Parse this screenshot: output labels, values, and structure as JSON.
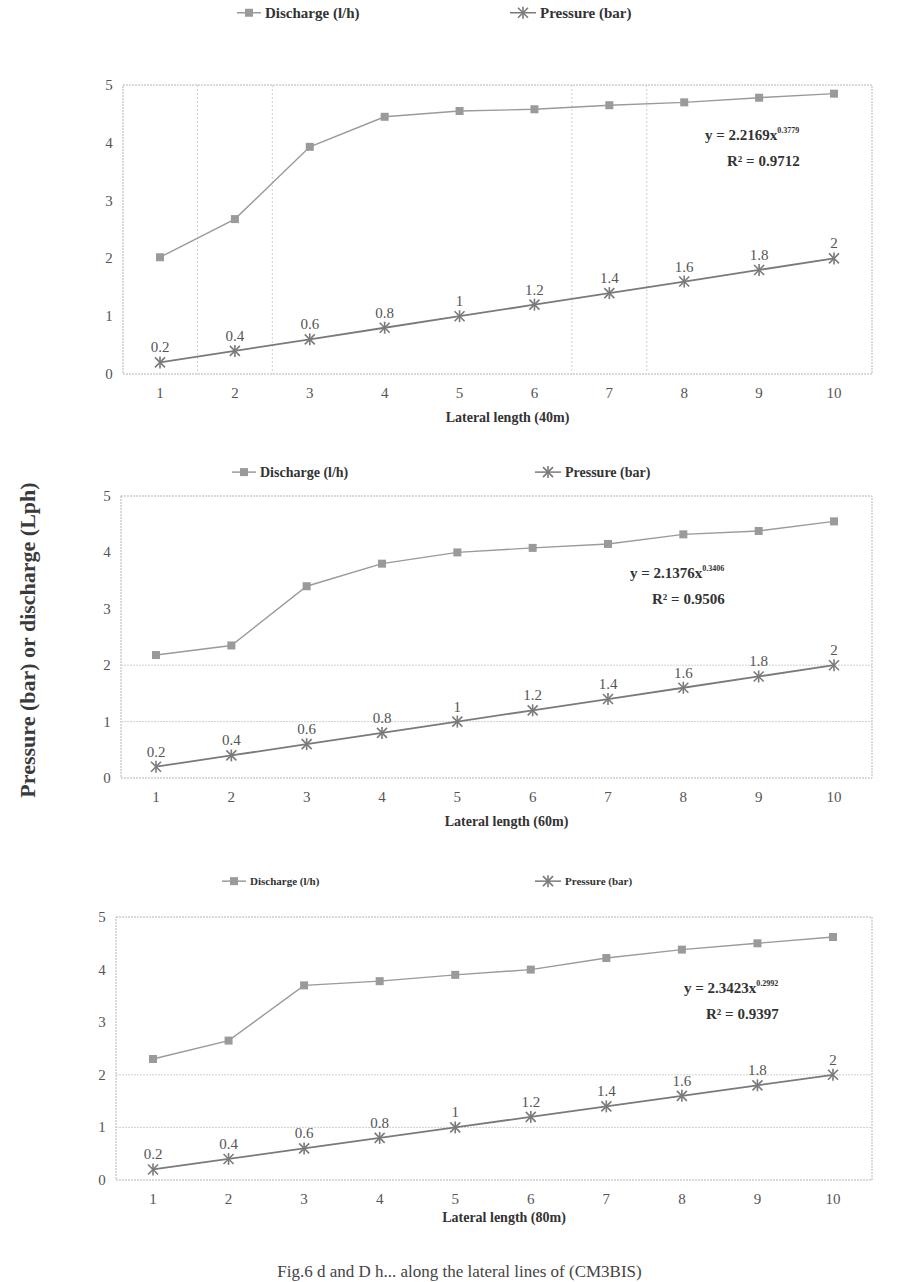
{
  "figure": {
    "shared_ylabel": "Pressure (bar) or discharge (Lph)",
    "caption": "Fig.6 d and D h... along the lateral lines of (CM3BIS)"
  },
  "colors": {
    "discharge": "#9a9a9a",
    "pressure": "#7a7a7a",
    "axis": "#b5b5b5",
    "grid": "#d0d0d0",
    "text": "#555555",
    "bold_text": "#333333"
  },
  "chart_data": [
    {
      "type": "line",
      "title": "",
      "xlabel": "Lateral length (40m)",
      "ylabel": "Pressure (bar) or discharge (Lph)",
      "x": [
        1,
        2,
        3,
        4,
        5,
        6,
        7,
        8,
        9,
        10
      ],
      "ylim": [
        0,
        5
      ],
      "yticks": [
        0,
        1,
        2,
        3,
        4,
        5
      ],
      "legend": {
        "position": "top",
        "entries": [
          "Discharge (l/h)",
          "Pressure (bar)"
        ]
      },
      "grid": {
        "horizontal": false,
        "vertical_dotted_at": [
          1.5,
          2.5,
          6.5,
          7.5
        ]
      },
      "series": [
        {
          "name": "Discharge (l/h)",
          "marker": "square",
          "values": [
            2.02,
            2.68,
            3.93,
            4.45,
            4.55,
            4.58,
            4.65,
            4.7,
            4.78,
            4.85
          ]
        },
        {
          "name": "Pressure (bar)",
          "marker": "asterisk",
          "values": [
            0.2,
            0.4,
            0.6,
            0.8,
            1.0,
            1.2,
            1.4,
            1.6,
            1.8,
            2.0
          ],
          "data_labels": [
            "0.2",
            "0.4",
            "0.6",
            "0.8",
            "1",
            "1.2",
            "1.4",
            "1.6",
            "1.8",
            "2"
          ]
        }
      ],
      "annotation": {
        "equation": "y = 2.2169x",
        "exponent": "0.3779",
        "r2": "R² = 0.9712"
      },
      "layout": {
        "top": 85,
        "bottom": 374,
        "left": 123,
        "right": 872,
        "x1": 160,
        "x10": 834,
        "legend_y": 18,
        "legend1_x": 265,
        "legend2_x": 540,
        "xlabel_y": 422,
        "eq_x": 705,
        "eq_y": 140,
        "legend_font": 15
      }
    },
    {
      "type": "line",
      "title": "",
      "xlabel": "Lateral length (60m)",
      "ylabel": "Pressure (bar) or discharge (Lph)",
      "x": [
        1,
        2,
        3,
        4,
        5,
        6,
        7,
        8,
        9,
        10
      ],
      "ylim": [
        0,
        5
      ],
      "yticks": [
        0,
        1,
        2,
        3,
        4,
        5
      ],
      "legend": {
        "position": "top",
        "entries": [
          "Discharge (l/h)",
          "Pressure (bar)"
        ]
      },
      "grid": {
        "horizontal_at": [
          1,
          2
        ]
      },
      "series": [
        {
          "name": "Discharge (l/h)",
          "marker": "square",
          "values": [
            2.18,
            2.35,
            3.4,
            3.8,
            4.0,
            4.08,
            4.15,
            4.32,
            4.38,
            4.55
          ]
        },
        {
          "name": "Pressure (bar)",
          "marker": "asterisk",
          "values": [
            0.2,
            0.4,
            0.6,
            0.8,
            1.0,
            1.2,
            1.4,
            1.6,
            1.8,
            2.0
          ],
          "data_labels": [
            "0.2",
            "0.4",
            "0.6",
            "0.8",
            "1",
            "1.2",
            "1.4",
            "1.6",
            "1.8",
            "2"
          ]
        }
      ],
      "annotation": {
        "equation": "y = 2.1376x",
        "exponent": "0.3406",
        "r2": "R² = 0.9506"
      },
      "layout": {
        "top": 496,
        "bottom": 778,
        "left": 121,
        "right": 872,
        "x1": 156,
        "x10": 834,
        "legend_y": 477,
        "legend1_x": 260,
        "legend2_x": 565,
        "xlabel_y": 826,
        "eq_x": 630,
        "eq_y": 578,
        "legend_font": 14
      }
    },
    {
      "type": "line",
      "title": "",
      "xlabel": "Lateral length (80m)",
      "ylabel": "Pressure (bar) or discharge (Lph)",
      "x": [
        1,
        2,
        3,
        4,
        5,
        6,
        7,
        8,
        9,
        10
      ],
      "ylim": [
        0,
        5
      ],
      "yticks": [
        0,
        1,
        2,
        3,
        4,
        5
      ],
      "legend": {
        "position": "top",
        "entries": [
          "Discharge (l/h)",
          "Pressure (bar)"
        ]
      },
      "grid": {
        "horizontal_at": [
          1,
          2
        ]
      },
      "series": [
        {
          "name": "Discharge (l/h)",
          "marker": "square",
          "values": [
            2.3,
            2.65,
            3.7,
            3.78,
            3.9,
            4.0,
            4.22,
            4.38,
            4.5,
            4.62
          ]
        },
        {
          "name": "Pressure (bar)",
          "marker": "asterisk",
          "values": [
            0.2,
            0.4,
            0.6,
            0.8,
            1.0,
            1.2,
            1.4,
            1.6,
            1.8,
            2.0
          ],
          "data_labels": [
            "0.2",
            "0.4",
            "0.6",
            "0.8",
            "1",
            "1.2",
            "1.4",
            "1.6",
            "1.8",
            "2"
          ]
        }
      ],
      "annotation": {
        "equation": "y = 2.3423x",
        "exponent": "0.2992",
        "r2": "R² = 0.9397"
      },
      "layout": {
        "top": 917,
        "bottom": 1180,
        "left": 116,
        "right": 872,
        "x1": 153,
        "x10": 833,
        "legend_y": 885,
        "legend1_x": 250,
        "legend2_x": 565,
        "xlabel_y": 1222,
        "eq_x": 684,
        "eq_y": 993,
        "legend_font": 11
      }
    }
  ]
}
